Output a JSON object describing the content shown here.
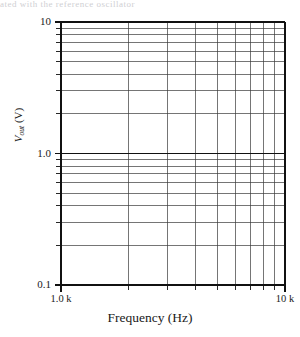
{
  "figure": {
    "top_cut_text": "ated with the reference oscillator",
    "background": "#ffffff",
    "ink_color": "#1a1a1a"
  },
  "chart_data": {
    "type": "line",
    "title": "",
    "subtitle": "",
    "xlabel": "Frequency (Hz)",
    "ylabel": "V_out (V)",
    "ylabel_parts": {
      "symbol": "V",
      "subscript": "out",
      "unit": "(V)"
    },
    "xscale": "log",
    "yscale": "log",
    "xlim": [
      1000,
      10000
    ],
    "ylim": [
      0.1,
      10
    ],
    "grid": true,
    "grid_minor": true,
    "legend": null,
    "legend_position": "none",
    "series": [],
    "annotations": [],
    "xticks": [
      1000,
      10000
    ],
    "xticklabels": [
      "1.0 k",
      "10 k"
    ],
    "xticklabel_left": "1.0 k",
    "xticklabel_right": "10 k",
    "yticks": [
      0.1,
      1.0,
      10
    ],
    "yticklabels": [
      "0.1",
      "1.0",
      "10"
    ],
    "x_minor_ticks": [
      2000,
      3000,
      4000,
      5000,
      6000,
      7000,
      8000,
      9000
    ],
    "y_minor_ticks": [
      0.2,
      0.3,
      0.4,
      0.5,
      0.6,
      0.7,
      0.8,
      0.9,
      2,
      3,
      4,
      5,
      6,
      7,
      8,
      9
    ],
    "values": [],
    "x": []
  }
}
